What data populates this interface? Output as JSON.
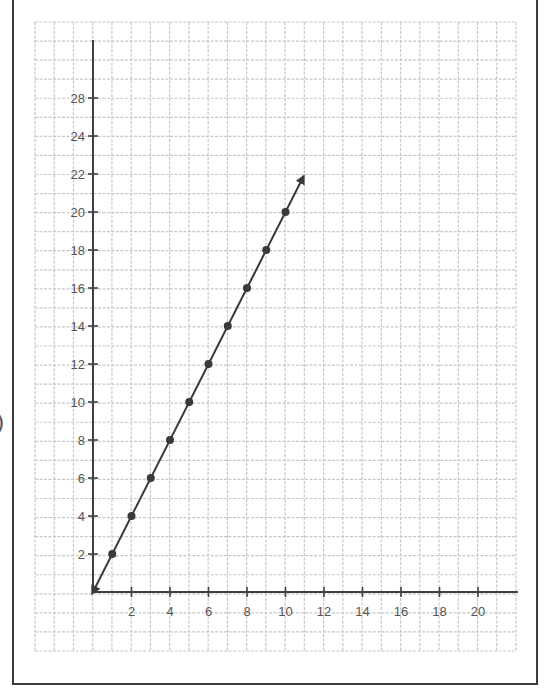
{
  "chart_data": {
    "type": "line",
    "title": "",
    "xlabel": "",
    "ylabel": "",
    "grid": true,
    "x_ticks": [
      2,
      4,
      6,
      8,
      10,
      12,
      14,
      16,
      18,
      20
    ],
    "y_tick_labels": [
      {
        "label": "2",
        "value": 2
      },
      {
        "label": "4",
        "value": 4
      },
      {
        "label": "6",
        "value": 6
      },
      {
        "label": "8",
        "value": 8
      },
      {
        "label": "10",
        "value": 10
      },
      {
        "label": "12",
        "value": 12
      },
      {
        "label": "14",
        "value": 14
      },
      {
        "label": "16",
        "value": 16
      },
      {
        "label": "18",
        "value": 18
      },
      {
        "label": "20",
        "value": 20
      },
      {
        "label": "22",
        "value": 22
      },
      {
        "label": "24",
        "value": 24
      },
      {
        "label": "28",
        "value": 26
      }
    ],
    "series": [
      {
        "name": "y = 2x",
        "x": [
          1,
          2,
          3,
          4,
          5,
          6,
          7,
          8,
          9,
          10
        ],
        "y": [
          2,
          4,
          6,
          8,
          10,
          12,
          14,
          16,
          18,
          20
        ],
        "markers": true,
        "arrow_end": [
          10.9,
          21.8
        ],
        "arrow_start": [
          0,
          0
        ]
      }
    ],
    "xlim": [
      0,
      22
    ],
    "ylim": [
      0,
      29
    ]
  },
  "colors": {
    "grid": "#c8c8c8",
    "axis": "#404040",
    "line": "#3a3a3a",
    "frame": "#3c3c3c",
    "label": "#555555"
  },
  "edge_glyph": ")"
}
